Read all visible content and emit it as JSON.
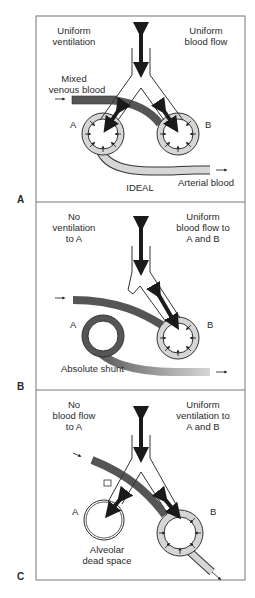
{
  "figure": {
    "panels": [
      {
        "id": "A",
        "panel_label": "A",
        "caption": "IDEAL",
        "top_left": [
          "Uniform",
          "ventilation"
        ],
        "top_right": [
          "Uniform",
          "blood flow"
        ],
        "inflow_label": [
          "Mixed",
          "venous blood"
        ],
        "outflow_label": "Arterial blood",
        "alveolus_a": "A",
        "alveolus_b": "B"
      },
      {
        "id": "B",
        "panel_label": "B",
        "top_left": [
          "No",
          "ventilation",
          "to A"
        ],
        "top_right": [
          "Uniform",
          "blood flow to",
          "A and B"
        ],
        "bottom_label": "Absolute shunt",
        "alveolus_a": "A",
        "alveolus_b": "B"
      },
      {
        "id": "C",
        "panel_label": "C",
        "top_left": [
          "No",
          "blood flow",
          "to A"
        ],
        "top_right": [
          "Uniform",
          "ventilation to",
          "A and B"
        ],
        "bottom_label": [
          "Alveolar",
          "dead space"
        ],
        "alveolus_a": "A",
        "alveolus_b": "B"
      }
    ],
    "colors": {
      "venous": "#555555",
      "arterial": "#d6d6d6",
      "outline": "#333333",
      "frame": "#777777",
      "arrow": "#1a1a1a"
    }
  }
}
